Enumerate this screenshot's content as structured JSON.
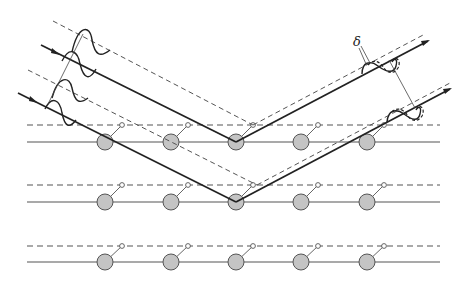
{
  "diagram": {
    "title": "",
    "labels": {
      "delta": "δ"
    },
    "colors": {
      "atom_fill": "#c4c4c4",
      "line": "#555555",
      "ray": "#222222",
      "background": "#ffffff"
    },
    "rows": [
      {
        "solid_y": 142,
        "dashed_y": 125
      },
      {
        "solid_y": 202,
        "dashed_y": 185
      },
      {
        "solid_y": 262,
        "dashed_y": 246
      }
    ],
    "atom_x": [
      105,
      171,
      236,
      301,
      367
    ],
    "atom_radius": 8,
    "incoming_rays": [
      {
        "name": "upper",
        "from": [
          40,
          45
        ],
        "to": [
          236,
          142
        ]
      },
      {
        "name": "lower",
        "from": [
          18,
          93
        ],
        "to": [
          236,
          202
        ]
      }
    ],
    "outgoing_rays": [
      {
        "name": "upper",
        "from": [
          236,
          142
        ],
        "to": [
          428,
          40
        ]
      },
      {
        "name": "lower",
        "from": [
          236,
          202
        ],
        "to": [
          450,
          89
        ]
      }
    ],
    "components": {
      "incident_wavefront": "sinusoidal wave packets on incoming rays",
      "scattered_wavefront": "phase-shifted double waves on outgoing rays",
      "phase_shift_label": "δ"
    }
  }
}
